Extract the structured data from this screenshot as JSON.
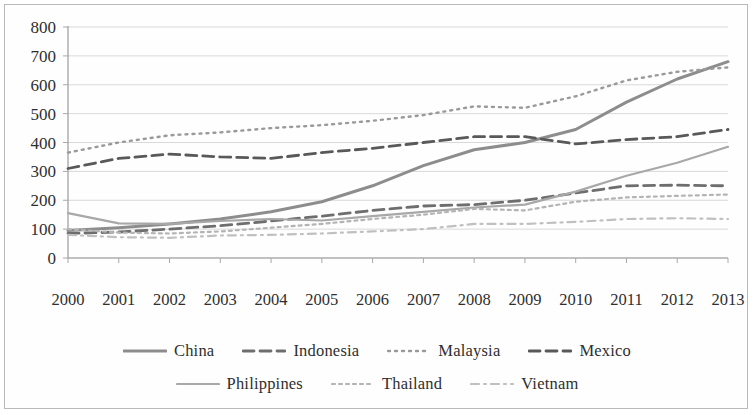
{
  "chart_data": {
    "type": "line",
    "title": "",
    "xlabel": "",
    "ylabel": "",
    "ylim": [
      0,
      800
    ],
    "ytick_step": 100,
    "grid": true,
    "legend_position": "bottom",
    "categories": [
      "2000",
      "2001",
      "2002",
      "2003",
      "2004",
      "2005",
      "2006",
      "2007",
      "2008",
      "2009",
      "2010",
      "2011",
      "2012",
      "2013"
    ],
    "yticks": [
      "800",
      "700",
      "600",
      "500",
      "400",
      "300",
      "200",
      "100",
      "0"
    ],
    "series": [
      {
        "name": "China",
        "style": "solid",
        "color": "#8d8d8d",
        "values": [
          95,
          105,
          118,
          135,
          160,
          195,
          250,
          320,
          375,
          400,
          445,
          540,
          620,
          680
        ]
      },
      {
        "name": "Indonesia",
        "style": "dashed",
        "color": "#6e6e6e",
        "values": [
          85,
          90,
          100,
          112,
          128,
          145,
          165,
          180,
          185,
          200,
          225,
          250,
          252,
          250
        ]
      },
      {
        "name": "Malaysia",
        "style": "dotted",
        "color": "#9a9a9a",
        "values": [
          365,
          400,
          425,
          435,
          450,
          460,
          475,
          495,
          525,
          520,
          560,
          615,
          645,
          660
        ]
      },
      {
        "name": "Mexico",
        "style": "dashed",
        "color": "#595959",
        "values": [
          310,
          345,
          360,
          350,
          345,
          365,
          380,
          400,
          420,
          420,
          395,
          410,
          420,
          445
        ]
      },
      {
        "name": "Philippines",
        "style": "solid-light",
        "color": "#a8a8a8",
        "values": [
          155,
          120,
          118,
          128,
          135,
          130,
          145,
          160,
          175,
          185,
          230,
          285,
          330,
          385
        ]
      },
      {
        "name": "Thailand",
        "style": "dotted-light",
        "color": "#b4b4b4",
        "values": [
          100,
          88,
          85,
          92,
          105,
          118,
          135,
          150,
          170,
          165,
          195,
          210,
          215,
          220
        ]
      },
      {
        "name": "Vietnam",
        "style": "dash-dot",
        "color": "#c0c0c0",
        "values": [
          80,
          72,
          70,
          78,
          80,
          85,
          92,
          100,
          118,
          118,
          125,
          135,
          138,
          135
        ]
      }
    ]
  },
  "legend": {
    "rows": [
      [
        {
          "label": "China",
          "swatch": "line-solid-swatch"
        },
        {
          "label": "Indonesia",
          "swatch": "line-dashed-swatch"
        },
        {
          "label": "Malaysia",
          "swatch": "line-dotted-swatch"
        },
        {
          "label": "Mexico",
          "swatch": "line-dashed-swatch"
        }
      ],
      [
        {
          "label": "Philippines",
          "swatch": "line-solid-light-swatch"
        },
        {
          "label": "Thailand",
          "swatch": "line-dotted-light-swatch"
        },
        {
          "label": "Vietnam",
          "swatch": "line-dash-dot-swatch"
        }
      ]
    ]
  }
}
